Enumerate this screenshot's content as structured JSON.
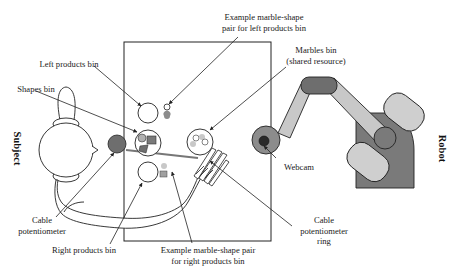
{
  "diagram": {
    "type": "experimental-setup",
    "actors": {
      "subject_label": "Subject",
      "robot_label": "Robot"
    },
    "labels": {
      "example_left_line1": "Example marble-shape",
      "example_left_line2": "pair for left products bin",
      "marbles_bin_line1": "Marbles bin",
      "marbles_bin_line2": "(shared resource)",
      "left_products_bin": "Left products bin",
      "shapes_bin": "Shapes bin",
      "webcam": "Webcam",
      "cable_pot_line1": "Cable",
      "cable_pot_line2": "potentiometer",
      "cable_ring_line1": "Cable",
      "cable_ring_line2": "potentiometer",
      "cable_ring_line3": "ring",
      "right_products_bin": "Right products bin",
      "example_right_line1": "Example marble-shape pair",
      "example_right_line2": "for right products bin"
    },
    "colors": {
      "stroke": "#222222",
      "dark_gray": "#6e6e6e",
      "mid_gray": "#8c8c8c",
      "light_gray": "#c8c8c8",
      "marble_gray": "#a8a8a8",
      "background": "#ffffff"
    }
  }
}
